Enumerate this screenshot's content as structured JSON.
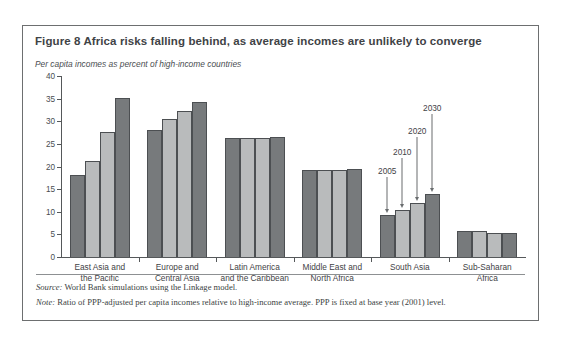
{
  "figure": {
    "title": "Figure 8  Africa risks falling behind, as average incomes are unlikely to converge",
    "subtitle": "Per capita incomes as percent of high-income countries",
    "source_label": "Source:",
    "source_text": " World Bank simulations using the Linkage model.",
    "note_label": "Note:",
    "note_text": " Ratio of PPP-adjusted per capita incomes relative to high-income average. PPP is fixed at base year (2001) level."
  },
  "colors": {
    "bar_dark": "#777a7c",
    "bar_light": "#b9bbbc",
    "axis": "#55585a",
    "text": "#3f4346",
    "border": "#6d6f70"
  },
  "annotations": [
    {
      "label": "2005",
      "series_index": 0
    },
    {
      "label": "2010",
      "series_index": 1
    },
    {
      "label": "2020",
      "series_index": 2
    },
    {
      "label": "2030",
      "series_index": 3
    }
  ],
  "chart_data": {
    "type": "bar",
    "title": "Figure 8  Africa risks falling behind, as average incomes are unlikely to converge",
    "subtitle": "Per capita incomes as percent of high-income countries",
    "xlabel": "",
    "ylabel": "",
    "ylim": [
      0,
      40
    ],
    "yticks": [
      0,
      5,
      10,
      15,
      20,
      25,
      30,
      35,
      40
    ],
    "ytick_labels": [
      "0",
      "5",
      "10",
      "15",
      "20",
      "25",
      "30",
      "35",
      "40"
    ],
    "grid": false,
    "legend": "none",
    "annotated_group": "South Asia",
    "categories": [
      "East Asia and the Pacific",
      "Europe and Central Asia",
      "Latin America and the Caribbean",
      "Middle East and North Africa",
      "South Asia",
      "Sub-Saharan Africa"
    ],
    "category_lines": [
      [
        "East Asia and",
        "the Pacific"
      ],
      [
        "Europe and",
        "Central Asia"
      ],
      [
        "Latin America",
        "and the Caribbean"
      ],
      [
        "Middle East and",
        "North Africa"
      ],
      [
        "South Asia"
      ],
      [
        "Sub-Saharan",
        "Africa"
      ]
    ],
    "series": [
      {
        "name": "2005",
        "shade": "dark",
        "values": [
          18.2,
          28.1,
          26.4,
          19.2,
          9.2,
          5.8
        ]
      },
      {
        "name": "2010",
        "shade": "light",
        "values": [
          21.3,
          30.5,
          26.3,
          19.2,
          10.3,
          5.8
        ]
      },
      {
        "name": "2020",
        "shade": "light",
        "values": [
          27.6,
          32.3,
          26.2,
          19.2,
          12.0,
          5.4
        ]
      },
      {
        "name": "2030",
        "shade": "dark",
        "values": [
          35.2,
          34.2,
          26.5,
          19.5,
          13.9,
          5.3
        ]
      }
    ]
  }
}
